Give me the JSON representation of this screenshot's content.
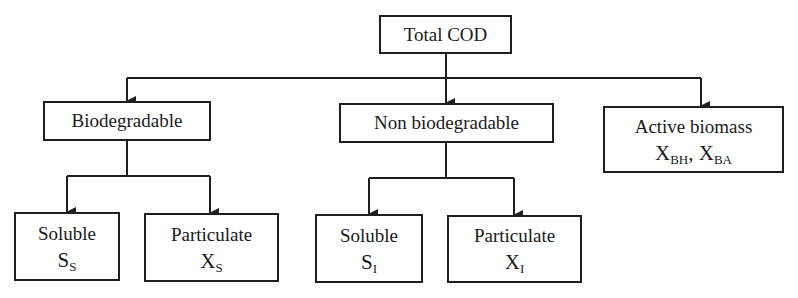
{
  "diagram": {
    "type": "tree",
    "root": {
      "label": "Total COD"
    },
    "level1": [
      {
        "id": "biodegradable",
        "label": "Biodegradable"
      },
      {
        "id": "non_biodegradable",
        "label": "Non biodegradable"
      },
      {
        "id": "active_biomass",
        "label": "Active biomass",
        "symbols": [
          {
            "base": "X",
            "sub": "BH"
          },
          {
            "base": "X",
            "sub": "BA"
          }
        ],
        "separator": ", "
      }
    ],
    "biodegradable_children": [
      {
        "label": "Soluble",
        "symbol": {
          "base": "S",
          "sub": "S"
        }
      },
      {
        "label": "Particulate",
        "symbol": {
          "base": "X",
          "sub": "S"
        }
      }
    ],
    "non_biodegradable_children": [
      {
        "label": "Soluble",
        "symbol": {
          "base": "S",
          "sub": "I"
        }
      },
      {
        "label": "Particulate",
        "symbol": {
          "base": "X",
          "sub": "I"
        }
      }
    ],
    "colors": {
      "line": "#1f1f1f",
      "background": "#ffffff",
      "text": "#1a1a1a"
    }
  }
}
